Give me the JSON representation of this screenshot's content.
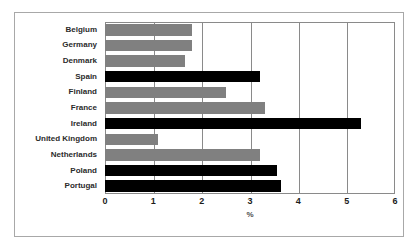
{
  "chart_data": {
    "type": "bar",
    "orientation": "horizontal",
    "title": "",
    "subtitle": "",
    "xlabel": "%",
    "ylabel": "",
    "xlim": [
      0,
      6
    ],
    "xticks": [
      "0",
      "1",
      "2",
      "3",
      "4",
      "5",
      "6"
    ],
    "grid": "vertical",
    "legend": "none",
    "categories": [
      "Belgium",
      "Germany",
      "Denmark",
      "Spain",
      "Finland",
      "France",
      "Ireland",
      "United Kingdom",
      "Netherlands",
      "Poland",
      "Portugal"
    ],
    "values": [
      1.8,
      1.8,
      1.65,
      3.2,
      2.5,
      3.3,
      5.3,
      1.1,
      3.2,
      3.55,
      3.65
    ],
    "bar_colors": [
      "#808080",
      "#808080",
      "#808080",
      "#000000",
      "#808080",
      "#808080",
      "#000000",
      "#808080",
      "#808080",
      "#000000",
      "#000000"
    ],
    "series": [
      {
        "name": "",
        "values": [
          1.8,
          1.8,
          1.65,
          3.2,
          2.5,
          3.3,
          5.3,
          1.1,
          3.2,
          3.55,
          3.65
        ]
      }
    ]
  },
  "colors": {
    "gray_bar": "#808080",
    "black_bar": "#000000",
    "axis": "#8a8a8a",
    "outer_frame": "#a8a8a8",
    "background": "#ffffff",
    "label_text": "#2b2b2b"
  }
}
